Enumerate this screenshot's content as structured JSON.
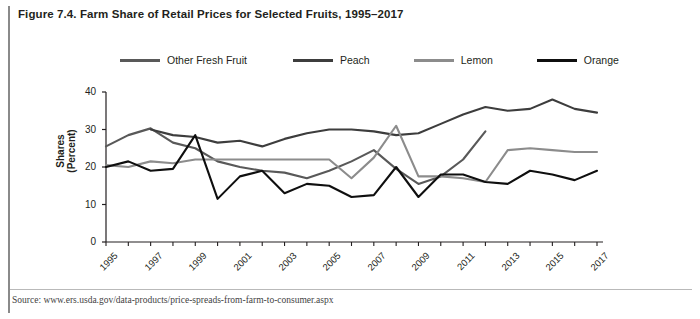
{
  "figure": {
    "title": "Figure 7.4. Farm Share of Retail Prices for Selected Fruits, 1995–2017",
    "source": "Source: www.ers.usda.gov/data-products/price-spreads-from-farm-to-consumer.aspx"
  },
  "chart_data": {
    "type": "line",
    "title": "Figure 7.4. Farm Share of Retail Prices for Selected Fruits, 1995–2017",
    "xlabel": "",
    "ylabel": "Shares (Percent)",
    "ylim": [
      0,
      40
    ],
    "yticks": [
      0,
      10,
      20,
      30,
      40
    ],
    "xlim": [
      1995,
      2017
    ],
    "x": [
      1995,
      1996,
      1997,
      1998,
      1999,
      2000,
      2001,
      2002,
      2003,
      2004,
      2005,
      2006,
      2007,
      2008,
      2009,
      2010,
      2011,
      2012,
      2013,
      2014,
      2015,
      2016,
      2017
    ],
    "xticklabels": [
      "1995",
      "1997",
      "1999",
      "2001",
      "2003",
      "2005",
      "2007",
      "2009",
      "2011",
      "2013",
      "2015",
      "2017"
    ],
    "grid": false,
    "legend_position": "top",
    "series": [
      {
        "name": "Other Fresh Fruit",
        "color": "#595959",
        "x": [
          1995,
          1996,
          1997,
          1998,
          1999,
          2000,
          2001,
          2002,
          2003,
          2004,
          2005,
          2006,
          2007,
          2008,
          2009,
          2010,
          2011,
          2012
        ],
        "values": [
          25.5,
          28.5,
          30.3,
          26.5,
          25.0,
          21.5,
          20.0,
          19.0,
          18.5,
          17.0,
          19.0,
          21.5,
          24.5,
          19.5,
          15.5,
          17.5,
          22.0,
          29.5
        ]
      },
      {
        "name": "Peach",
        "color": "#3d3d3d",
        "x": [
          1997,
          1998,
          1999,
          2000,
          2001,
          2002,
          2003,
          2004,
          2005,
          2006,
          2007,
          2008,
          2009,
          2010,
          2011,
          2012,
          2013,
          2014,
          2015,
          2016,
          2017
        ],
        "values": [
          30.0,
          28.5,
          28.0,
          26.5,
          27.0,
          25.5,
          27.5,
          29.0,
          30.0,
          30.0,
          29.5,
          28.5,
          29.0,
          31.5,
          34.0,
          36.0,
          35.0,
          35.5,
          38.0,
          35.5,
          34.5
        ]
      },
      {
        "name": "Lemon",
        "color": "#8c8c8c",
        "x": [
          1995,
          1996,
          1997,
          1998,
          1999,
          2000,
          2001,
          2002,
          2003,
          2004,
          2005,
          2006,
          2007,
          2008,
          2009,
          2010,
          2011,
          2012,
          2013,
          2014,
          2015,
          2016,
          2017
        ],
        "values": [
          20.5,
          20.0,
          21.5,
          21.0,
          22.0,
          22.0,
          22.0,
          22.0,
          22.0,
          22.0,
          22.0,
          17.0,
          22.5,
          31.0,
          17.5,
          17.5,
          17.0,
          16.0,
          24.5,
          25.0,
          24.5,
          24.0,
          24.0
        ]
      },
      {
        "name": "Orange",
        "color": "#0f0f0f",
        "x": [
          1995,
          1996,
          1997,
          1998,
          1999,
          2000,
          2001,
          2002,
          2003,
          2004,
          2005,
          2006,
          2007,
          2008,
          2009,
          2010,
          2011,
          2012,
          2013,
          2014,
          2015,
          2016,
          2017
        ],
        "values": [
          20.0,
          21.5,
          19.0,
          19.5,
          28.5,
          11.5,
          17.5,
          19.0,
          13.0,
          15.5,
          15.0,
          12.0,
          12.5,
          20.0,
          12.0,
          18.0,
          18.0,
          16.0,
          15.5,
          19.0,
          18.0,
          16.5,
          19.0
        ]
      }
    ]
  },
  "legend": {
    "items": [
      {
        "label": "Other Fresh Fruit",
        "color": "#595959"
      },
      {
        "label": "Peach",
        "color": "#3d3d3d"
      },
      {
        "label": "Lemon",
        "color": "#8c8c8c"
      },
      {
        "label": "Orange",
        "color": "#0f0f0f"
      }
    ]
  },
  "axes": {
    "y_title_line1": "Shares",
    "y_title_line2": "(Percent)",
    "yticks": [
      "0",
      "10",
      "20",
      "30",
      "40"
    ],
    "xticklabels": [
      "1995",
      "1997",
      "1999",
      "2001",
      "2003",
      "2005",
      "2007",
      "2009",
      "2011",
      "2013",
      "2015",
      "2017"
    ]
  },
  "colors": {
    "axis": "#231f20",
    "rule": "#8a8a8a",
    "divider": "#b9b9b9"
  }
}
